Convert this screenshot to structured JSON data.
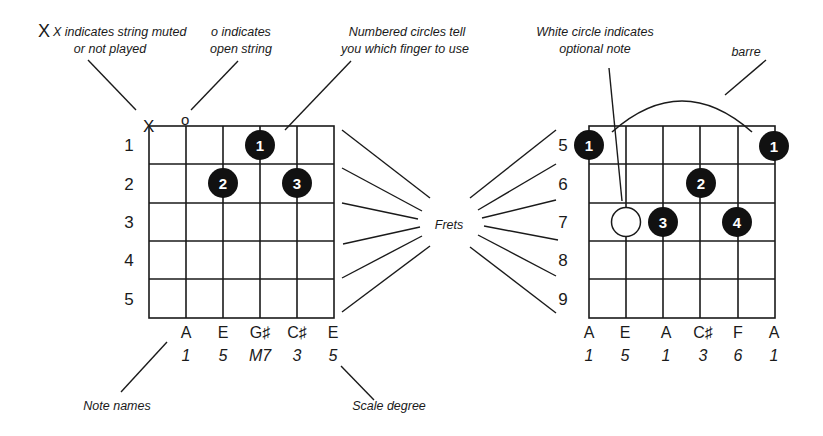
{
  "annotations": {
    "muted_line1": "X indicates string muted",
    "muted_line2": "or not played",
    "open_line1": "o indicates",
    "open_line2": "open string",
    "finger_line1": "Numbered circles tell",
    "finger_line2": "you which finger to use",
    "optional_line1": "White circle indicates",
    "optional_line2": "optional note",
    "barre": "barre",
    "frets": "Frets",
    "note_names": "Note names",
    "scale_degree": "Scale degree"
  },
  "left_chart": {
    "string_markers": {
      "muted": "X",
      "open": "o"
    },
    "fret_numbers": [
      "1",
      "2",
      "3",
      "4",
      "5"
    ],
    "fingers": [
      {
        "label": "1",
        "string": 4,
        "fret": 1
      },
      {
        "label": "2",
        "string": 3,
        "fret": 2
      },
      {
        "label": "3",
        "string": 5,
        "fret": 2
      }
    ],
    "note_names": [
      "A",
      "E",
      "G♯",
      "C♯",
      "E"
    ],
    "scale_degrees": [
      "1",
      "5",
      "M7",
      "3",
      "5"
    ]
  },
  "right_chart": {
    "fret_numbers": [
      "5",
      "6",
      "7",
      "8",
      "9"
    ],
    "fingers": [
      {
        "label": "1",
        "string": 1,
        "fret": 5
      },
      {
        "label": "1",
        "string": 6,
        "fret": 5
      },
      {
        "label": "2",
        "string": 4,
        "fret": 6
      },
      {
        "label": "3",
        "string": 3,
        "fret": 7
      },
      {
        "label": "4",
        "string": 5,
        "fret": 7
      }
    ],
    "optional_note": {
      "string": 2,
      "fret": 7
    },
    "note_names": [
      "A",
      "E",
      "A",
      "C♯",
      "F",
      "A"
    ],
    "scale_degrees": [
      "1",
      "5",
      "1",
      "3",
      "6",
      "1"
    ]
  }
}
